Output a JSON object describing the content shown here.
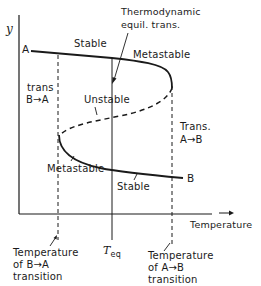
{
  "axes": {
    "y_label": "y",
    "x_label": "Temperature"
  },
  "curve_endpoints": {
    "start": "A",
    "end": "B"
  },
  "regions": {
    "upper_stable": "Stable",
    "upper_metastable": "Metastable",
    "unstable": "Unstable",
    "lower_metastable": "Metastable",
    "lower_stable": "Stable"
  },
  "annotations": {
    "equilibrium_line1": "Thermodynamic",
    "equilibrium_line2": "equil. trans.",
    "left_trans_line1": "trans",
    "left_trans_line2": "B→A",
    "right_trans_line1": "Trans.",
    "right_trans_line2": "A→B"
  },
  "x_markers": {
    "left_line1": "Temperature",
    "left_line2": "of  B→A",
    "left_line3": "transition",
    "center_symbol": "T",
    "center_subscript": "eq",
    "right_line1": "Temperature",
    "right_line2": "of  A→B",
    "right_line3": "transition"
  },
  "colors": {
    "ink": "#1a1a1a",
    "background": "#ffffff"
  }
}
